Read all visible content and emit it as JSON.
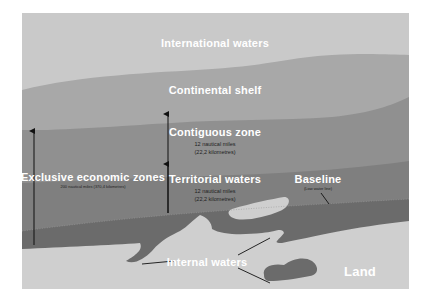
{
  "diagram": {
    "colors": {
      "international_waters": "#c9c9c9",
      "continental_shelf": "#a8a8a8",
      "contiguous_zone": "#909090",
      "territorial_waters": "#7f7f7f",
      "internal_waters": "#6b6b6b",
      "land": "#cfcfcf",
      "arrow": "#111111"
    },
    "labels": {
      "international_waters": "International waters",
      "continental_shelf": "Continental shelf",
      "contiguous_zone": {
        "title": "Contiguous zone",
        "line1": "12 nautical miles",
        "line2": "(22,2 kilometres)"
      },
      "territorial_waters": {
        "title": "Territorial waters",
        "line1": "12 nautical miles",
        "line2": "(22,2 kilometres)"
      },
      "exclusive_economic_zones": {
        "title": "Exclusive economic zones",
        "line1": "200 nautical miles (370,4 kilometres)"
      },
      "baseline": {
        "title": "Baseline",
        "line1": "(Low water line)"
      },
      "internal_waters": "Internal waters",
      "land": "Land"
    }
  }
}
